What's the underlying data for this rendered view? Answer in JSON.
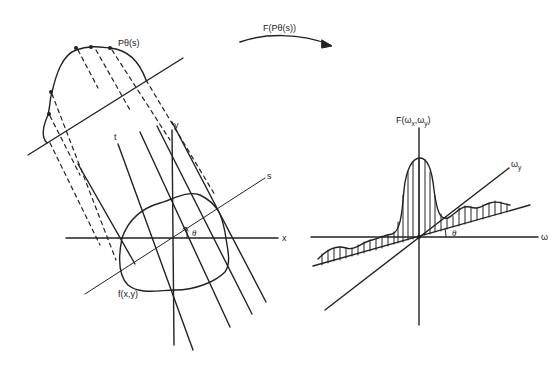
{
  "diagram": {
    "left_panel": {
      "projection_label": "Pθ(s)",
      "object_label": "f(x,y)",
      "axis_x": "x",
      "axis_y": "y",
      "axis_s": "s",
      "axis_t": "t",
      "angle": "θ"
    },
    "arrow": {
      "label": "F(Pθ(s))"
    },
    "right_panel": {
      "function_label_main": "F(ω",
      "function_label_sub1": "x",
      "function_label_mid": ",ω",
      "function_label_sub2": "y",
      "function_label_end": ")",
      "axis_wx": "ω",
      "axis_wy_main": "ω",
      "axis_wy_sub": "y",
      "angle": "θ"
    },
    "colors": {
      "ink": "#222222",
      "background": "#ffffff"
    }
  }
}
